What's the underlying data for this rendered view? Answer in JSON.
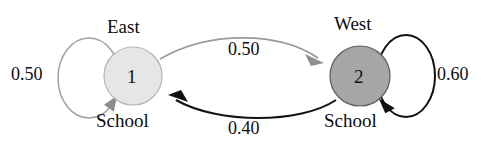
{
  "diagram": {
    "type": "markov-chain-state-diagram",
    "nodes": [
      {
        "id": "1",
        "name_top": "East",
        "name_bottom": "School",
        "fill": "#e6e6e6",
        "cx": 133,
        "cy": 76,
        "r": 29
      },
      {
        "id": "2",
        "name_top": "West",
        "name_bottom": "School",
        "fill": "#a6a6a6",
        "cx": 360,
        "cy": 76,
        "r": 30
      }
    ],
    "transitions": [
      {
        "from": "1",
        "to": "1",
        "label": "0.50",
        "style": "gray",
        "kind": "self-loop-left"
      },
      {
        "from": "1",
        "to": "2",
        "label": "0.50",
        "style": "gray",
        "kind": "arc-top"
      },
      {
        "from": "2",
        "to": "1",
        "label": "0.40",
        "style": "dark",
        "kind": "arc-bottom"
      },
      {
        "from": "2",
        "to": "2",
        "label": "0.60",
        "style": "dark",
        "kind": "self-loop-right"
      }
    ]
  }
}
